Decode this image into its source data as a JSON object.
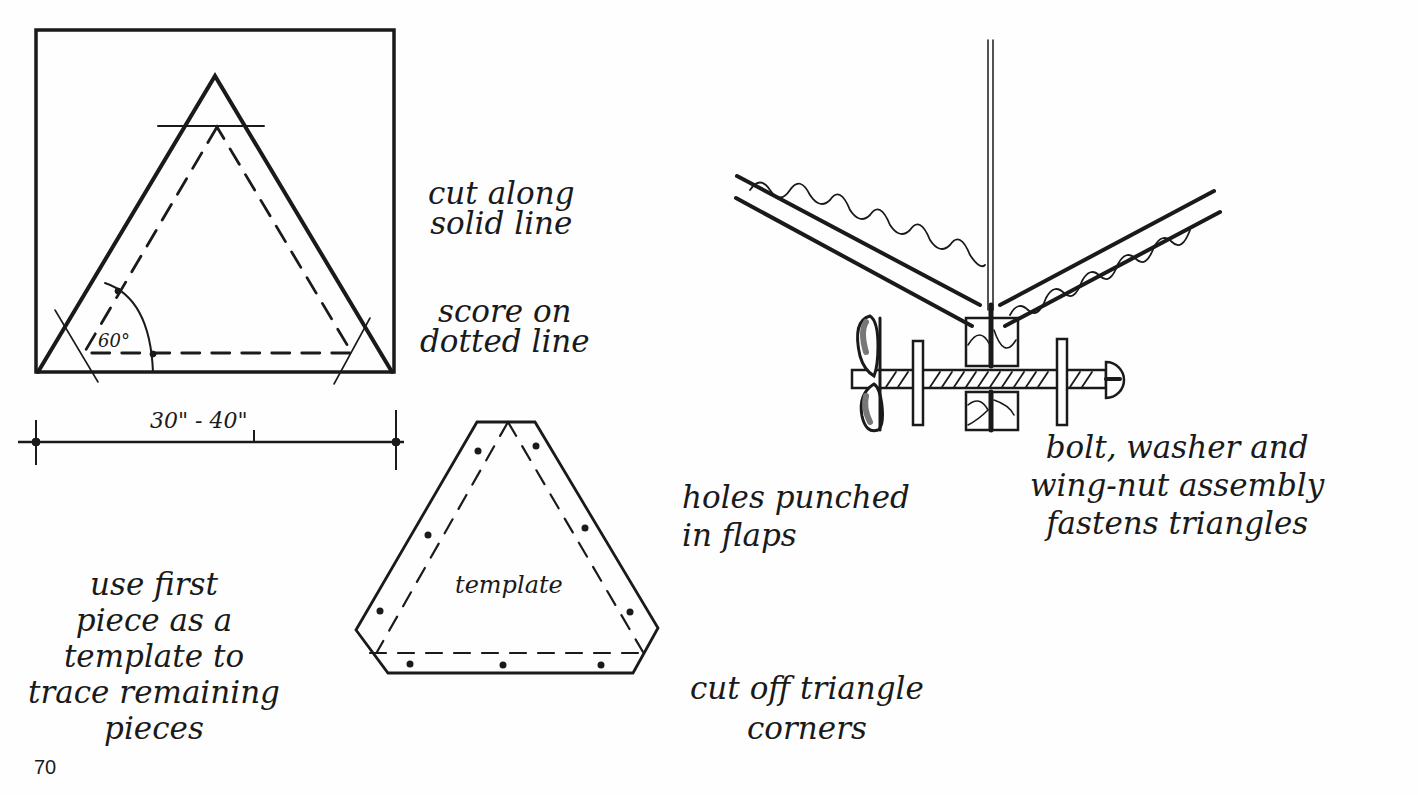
{
  "page": {
    "page_number": "70",
    "ink_color": "#1a1a1a",
    "paper_color": "#fefefe"
  },
  "left_diagram": {
    "angle_label": "60°",
    "dimension_label": "30\" - 40\"",
    "annotations": {
      "cut_solid": "cut along\nsolid line",
      "score_dotted": "score on\ndotted line"
    }
  },
  "template_diagram": {
    "center_label": "template",
    "annotations": {
      "use_first_piece": "use first\npiece as a\ntemplate to\ntrace remaining\npieces",
      "holes_punched": "holes punched\nin flaps",
      "cut_corners": "cut off triangle\ncorners"
    }
  },
  "assembly_diagram": {
    "annotations": {
      "bolt_assembly": "bolt, washer and\nwing-nut assembly\nfastens triangles"
    }
  }
}
